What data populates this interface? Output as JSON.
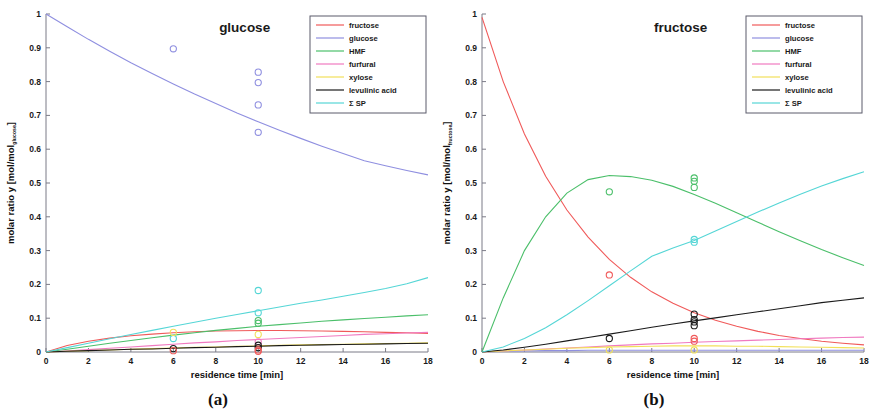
{
  "figure": {
    "panels": [
      {
        "id": "panel-a",
        "caption": "(a)",
        "title": "glucose",
        "xlabel": "residence time [min]",
        "ylabel_main": "molar ratio y  [mol/mol",
        "ylabel_sub": "glucose",
        "ylabel_close": "]"
      },
      {
        "id": "panel-b",
        "caption": "(b)",
        "title": "fructose",
        "xlabel": "residence time [min]",
        "ylabel_main": "molar ratio y  [mol/mol",
        "ylabel_sub": "fructose",
        "ylabel_close": "]"
      }
    ]
  },
  "colors": {
    "fructose": "#f05a5a",
    "glucose": "#8f8fe0",
    "HMF": "#4bbf6a",
    "furfural": "#f07ac0",
    "xylose": "#f2e05a",
    "levulinic acid": "#1a1a1a",
    "SP": "#55d6d6",
    "axis": "#7b7b87",
    "text": "#1a1a1a",
    "background": "#ffffff"
  },
  "chart_data": [
    {
      "type": "line",
      "panel": "a",
      "title": "glucose",
      "xlabel": "residence time [min]",
      "ylabel": "molar ratio y [mol/mol_glucose]",
      "xlim": [
        0,
        18
      ],
      "ylim": [
        0,
        1
      ],
      "xticks": [
        0,
        2,
        4,
        6,
        8,
        10,
        12,
        14,
        16,
        18
      ],
      "yticks": [
        0,
        0.1,
        0.2,
        0.3,
        0.4,
        0.5,
        0.6,
        0.7,
        0.8,
        0.9,
        1
      ],
      "grid": false,
      "legend_position": "top-right",
      "legend": [
        "fructose",
        "glucose",
        "HMF",
        "furfural",
        "xylose",
        "levulinic acid",
        "Σ SP"
      ],
      "x": [
        0,
        1,
        2,
        3,
        4,
        5,
        6,
        7,
        8,
        9,
        10,
        11,
        12,
        13,
        14,
        15,
        16,
        17,
        18
      ],
      "series": [
        {
          "name": "fructose",
          "color": "#f05a5a",
          "values": [
            0,
            0.019,
            0.032,
            0.041,
            0.048,
            0.053,
            0.057,
            0.06,
            0.062,
            0.063,
            0.0635,
            0.0635,
            0.063,
            0.062,
            0.061,
            0.06,
            0.058,
            0.057,
            0.055
          ]
        },
        {
          "name": "glucose",
          "color": "#8f8fe0",
          "values": [
            1.0,
            0.962,
            0.925,
            0.89,
            0.856,
            0.824,
            0.793,
            0.763,
            0.735,
            0.707,
            0.681,
            0.656,
            0.632,
            0.609,
            0.587,
            0.566,
            0.551,
            0.537,
            0.524
          ]
        },
        {
          "name": "HMF",
          "color": "#4bbf6a",
          "values": [
            0,
            0.008,
            0.017,
            0.026,
            0.034,
            0.042,
            0.05,
            0.057,
            0.064,
            0.07,
            0.076,
            0.081,
            0.086,
            0.091,
            0.095,
            0.099,
            0.103,
            0.107,
            0.11
          ]
        },
        {
          "name": "furfural",
          "color": "#f07ac0",
          "values": [
            0,
            0.003,
            0.007,
            0.011,
            0.015,
            0.019,
            0.023,
            0.027,
            0.03,
            0.034,
            0.037,
            0.04,
            0.043,
            0.046,
            0.049,
            0.052,
            0.054,
            0.056,
            0.058
          ]
        },
        {
          "name": "xylose",
          "color": "#f2e05a",
          "values": [
            0,
            0.002,
            0.004,
            0.006,
            0.008,
            0.01,
            0.012,
            0.014,
            0.015,
            0.017,
            0.018,
            0.02,
            0.021,
            0.022,
            0.023,
            0.024,
            0.025,
            0.026,
            0.027
          ]
        },
        {
          "name": "levulinic acid",
          "color": "#1a1a1a",
          "values": [
            0,
            0.002,
            0.004,
            0.006,
            0.008,
            0.009,
            0.011,
            0.013,
            0.014,
            0.016,
            0.017,
            0.019,
            0.02,
            0.021,
            0.022,
            0.023,
            0.024,
            0.025,
            0.026
          ]
        },
        {
          "name": "Σ SP",
          "color": "#55d6d6",
          "values": [
            0,
            0.013,
            0.026,
            0.039,
            0.052,
            0.064,
            0.076,
            0.088,
            0.1,
            0.111,
            0.122,
            0.133,
            0.144,
            0.154,
            0.165,
            0.176,
            0.188,
            0.202,
            0.22
          ]
        }
      ],
      "points": [
        {
          "series": "glucose",
          "color": "#8f8fe0",
          "x": 6,
          "y": 0.897
        },
        {
          "series": "glucose",
          "color": "#8f8fe0",
          "x": 10,
          "y": 0.828
        },
        {
          "series": "glucose",
          "color": "#8f8fe0",
          "x": 10,
          "y": 0.797
        },
        {
          "series": "glucose",
          "color": "#8f8fe0",
          "x": 10,
          "y": 0.731
        },
        {
          "series": "glucose",
          "color": "#8f8fe0",
          "x": 10,
          "y": 0.65
        },
        {
          "series": "Σ SP",
          "color": "#55d6d6",
          "x": 10,
          "y": 0.182
        },
        {
          "series": "Σ SP",
          "color": "#55d6d6",
          "x": 10,
          "y": 0.116
        },
        {
          "series": "Σ SP",
          "color": "#55d6d6",
          "x": 6,
          "y": 0.04
        },
        {
          "series": "HMF",
          "color": "#4bbf6a",
          "x": 10,
          "y": 0.093
        },
        {
          "series": "HMF",
          "color": "#4bbf6a",
          "x": 10,
          "y": 0.085
        },
        {
          "series": "xylose",
          "color": "#f2e05a",
          "x": 6,
          "y": 0.058
        },
        {
          "series": "xylose",
          "color": "#f2e05a",
          "x": 10,
          "y": 0.052
        },
        {
          "series": "furfural",
          "color": "#f07ac0",
          "x": 10,
          "y": 0.03
        },
        {
          "series": "levulinic acid",
          "color": "#1a1a1a",
          "x": 6,
          "y": 0.01
        },
        {
          "series": "levulinic acid",
          "color": "#1a1a1a",
          "x": 10,
          "y": 0.02
        },
        {
          "series": "levulinic acid",
          "color": "#1a1a1a",
          "x": 10,
          "y": 0.013
        },
        {
          "series": "fructose",
          "color": "#f05a5a",
          "x": 6,
          "y": 0.004
        },
        {
          "series": "fructose",
          "color": "#f05a5a",
          "x": 10,
          "y": 0.006
        },
        {
          "series": "fructose",
          "color": "#f05a5a",
          "x": 10,
          "y": 0.002
        }
      ]
    },
    {
      "type": "line",
      "panel": "b",
      "title": "fructose",
      "xlabel": "residence time [min]",
      "ylabel": "molar ratio y [mol/mol_fructose]",
      "xlim": [
        0,
        18
      ],
      "ylim": [
        0,
        1
      ],
      "xticks": [
        0,
        2,
        4,
        6,
        8,
        10,
        12,
        14,
        16,
        18
      ],
      "yticks": [
        0,
        0.1,
        0.2,
        0.3,
        0.4,
        0.5,
        0.6,
        0.7,
        0.8,
        0.9,
        1
      ],
      "grid": false,
      "legend_position": "top-right",
      "legend": [
        "fructose",
        "glucose",
        "HMF",
        "furfural",
        "xylose",
        "levulinic acid",
        "Σ SP"
      ],
      "x": [
        0,
        1,
        2,
        3,
        4,
        5,
        6,
        7,
        8,
        9,
        10,
        11,
        12,
        13,
        14,
        15,
        16,
        17,
        18
      ],
      "series": [
        {
          "name": "fructose",
          "color": "#f05a5a",
          "values": [
            0.99,
            0.8,
            0.645,
            0.52,
            0.42,
            0.34,
            0.274,
            0.221,
            0.178,
            0.144,
            0.116,
            0.094,
            0.076,
            0.061,
            0.049,
            0.04,
            0.032,
            0.026,
            0.021
          ]
        },
        {
          "name": "glucose",
          "color": "#8f8fe0",
          "values": [
            0,
            0.002,
            0.003,
            0.004,
            0.004,
            0.005,
            0.005,
            0.005,
            0.005,
            0.005,
            0.005,
            0.005,
            0.005,
            0.005,
            0.005,
            0.005,
            0.005,
            0.005,
            0.005
          ]
        },
        {
          "name": "HMF",
          "color": "#4bbf6a",
          "values": [
            0,
            0.16,
            0.3,
            0.4,
            0.47,
            0.51,
            0.522,
            0.519,
            0.508,
            0.49,
            0.466,
            0.44,
            0.412,
            0.384,
            0.356,
            0.329,
            0.303,
            0.279,
            0.256
          ]
        },
        {
          "name": "furfural",
          "color": "#f07ac0",
          "values": [
            0,
            0.003,
            0.006,
            0.009,
            0.012,
            0.015,
            0.018,
            0.021,
            0.024,
            0.026,
            0.029,
            0.031,
            0.033,
            0.035,
            0.037,
            0.039,
            0.041,
            0.043,
            0.044
          ]
        },
        {
          "name": "xylose",
          "color": "#f2e05a",
          "values": [
            0,
            0.003,
            0.006,
            0.008,
            0.011,
            0.013,
            0.015,
            0.016,
            0.017,
            0.018,
            0.018,
            0.018,
            0.017,
            0.017,
            0.016,
            0.015,
            0.014,
            0.013,
            0.012
          ]
        },
        {
          "name": "levulinic acid",
          "color": "#1a1a1a",
          "values": [
            0,
            0.006,
            0.014,
            0.023,
            0.033,
            0.043,
            0.053,
            0.063,
            0.073,
            0.083,
            0.092,
            0.101,
            0.11,
            0.119,
            0.128,
            0.137,
            0.146,
            0.153,
            0.16
          ]
        },
        {
          "name": "Σ SP",
          "color": "#55d6d6",
          "values": [
            0,
            0.015,
            0.04,
            0.072,
            0.11,
            0.152,
            0.196,
            0.24,
            0.283,
            0.308,
            0.33,
            0.358,
            0.386,
            0.414,
            0.441,
            0.467,
            0.491,
            0.513,
            0.533
          ]
        }
      ],
      "points": [
        {
          "series": "HMF",
          "color": "#4bbf6a",
          "x": 6,
          "y": 0.474
        },
        {
          "series": "HMF",
          "color": "#4bbf6a",
          "x": 10,
          "y": 0.515
        },
        {
          "series": "HMF",
          "color": "#4bbf6a",
          "x": 10,
          "y": 0.505
        },
        {
          "series": "HMF",
          "color": "#4bbf6a",
          "x": 10,
          "y": 0.487
        },
        {
          "series": "Σ SP",
          "color": "#55d6d6",
          "x": 10,
          "y": 0.333
        },
        {
          "series": "Σ SP",
          "color": "#55d6d6",
          "x": 10,
          "y": 0.325
        },
        {
          "series": "fructose",
          "color": "#f05a5a",
          "x": 6,
          "y": 0.228
        },
        {
          "series": "levulinic acid",
          "color": "#1a1a1a",
          "x": 10,
          "y": 0.112
        },
        {
          "series": "levulinic acid",
          "color": "#1a1a1a",
          "x": 10,
          "y": 0.096
        },
        {
          "series": "levulinic acid",
          "color": "#1a1a1a",
          "x": 10,
          "y": 0.089
        },
        {
          "series": "levulinic acid",
          "color": "#1a1a1a",
          "x": 10,
          "y": 0.078
        },
        {
          "series": "levulinic acid",
          "color": "#1a1a1a",
          "x": 6,
          "y": 0.04
        },
        {
          "series": "fructose",
          "color": "#f05a5a",
          "x": 10,
          "y": 0.04
        },
        {
          "series": "fructose",
          "color": "#f05a5a",
          "x": 10,
          "y": 0.032
        },
        {
          "series": "xylose",
          "color": "#f2e05a",
          "x": 6,
          "y": 0.006
        },
        {
          "series": "xylose",
          "color": "#f2e05a",
          "x": 10,
          "y": 0.006
        }
      ]
    }
  ]
}
